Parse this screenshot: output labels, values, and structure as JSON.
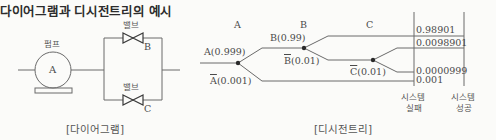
{
  "title": "다이어그램과 디시전트리의 예시",
  "diagram": {
    "pump_label": "펌프",
    "pump_letter": "A",
    "valve_top_label": "밸브",
    "valve_top_letter": "B",
    "valve_bottom_label": "밸브",
    "valve_bottom_letter": "C",
    "caption": "[다이어그램]"
  },
  "decision_tree": {
    "column_headers": [
      "A",
      "B",
      "C"
    ],
    "branches": {
      "a_success": "A(0.999)",
      "a_fail_letter": "A",
      "a_fail_prob": "(0.001)",
      "b_success": "B(0.99)",
      "b_fail_letter": "B",
      "b_fail_prob": "(0.01)",
      "c_fail_letter": "C",
      "c_fail_prob": "(0.01)"
    },
    "outcomes": [
      "0.98901",
      "0.0098901",
      "0.0000999",
      "0.001"
    ],
    "column_labels": {
      "failure_line1": "시스템",
      "failure_line2": "실패",
      "success_line1": "시스템",
      "success_line2": "성공"
    },
    "caption": "[디시전트리]"
  },
  "colors": {
    "line": "#6a6a6a",
    "node": "#2a2a2a",
    "background": "#fbfbf9"
  }
}
